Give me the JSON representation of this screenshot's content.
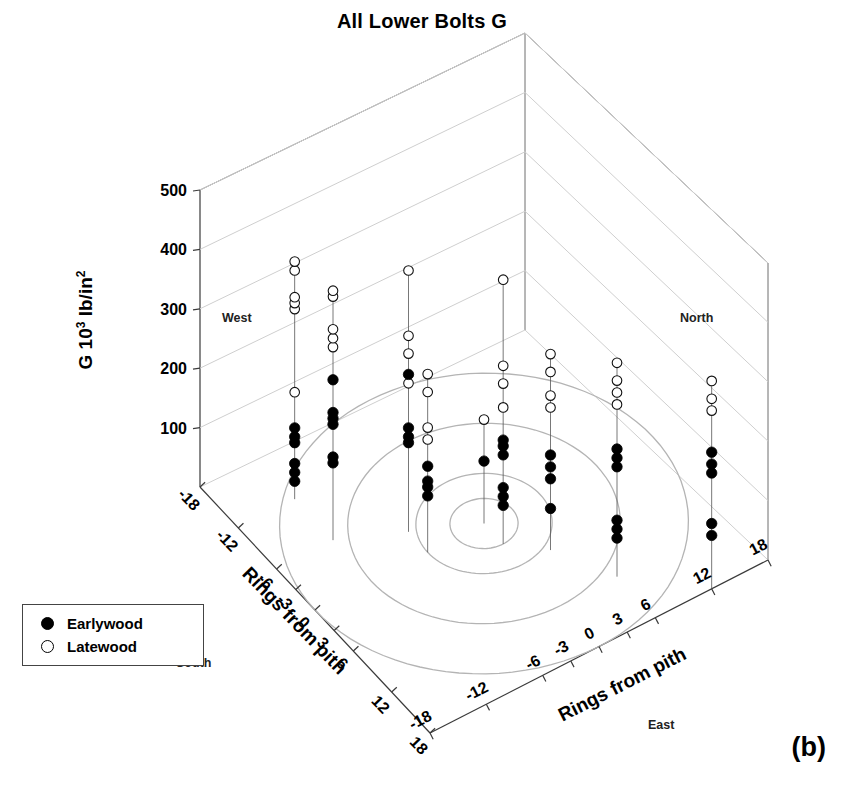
{
  "title": "All Lower Bolts G",
  "panel_label": "(b)",
  "legend": {
    "items": [
      {
        "label": "Earlywood",
        "marker": "filled-circle-icon",
        "color": "#000000"
      },
      {
        "label": "Latewood",
        "marker": "open-circle-icon",
        "color": "#ffffff"
      }
    ]
  },
  "compass": {
    "west": "West",
    "north": "North",
    "south": "South",
    "east": "East"
  },
  "zaxis": {
    "title_main": "G 10",
    "title_sup1": "3",
    "title_mid": " lb/in",
    "title_sup2": "2",
    "ticks": [
      "500",
      "400",
      "300",
      "200",
      "100"
    ]
  },
  "left_axis": {
    "title": "Rings from pith",
    "ticks": [
      "-18",
      "-12",
      "-6",
      "-3",
      "0",
      "3",
      "6",
      "12",
      "18"
    ]
  },
  "right_axis": {
    "title": "Rings from pith",
    "ticks": [
      "-18",
      "-12",
      "-6",
      "-3",
      "0",
      "3",
      "6",
      "12",
      "18"
    ]
  },
  "colors": {
    "earlywood": "#000000",
    "latewood": "#ffffff",
    "axis": "#3a3a3a",
    "grid": "#cfcfcf",
    "ring": "#b4b4b4"
  },
  "chart_data": {
    "type": "scatter",
    "projection": "3d",
    "title": "All Lower Bolts G",
    "xlabel": "Rings from pith",
    "ylabel": "Rings from pith",
    "zlabel": "G 10^3 lb/in^2",
    "xlim": [
      -18,
      18
    ],
    "ylim": [
      -18,
      18
    ],
    "zlim": [
      0,
      500
    ],
    "ztick_values": [
      100,
      200,
      300,
      400,
      500
    ],
    "xtick_values": [
      -18,
      -12,
      -6,
      -3,
      0,
      3,
      6,
      12,
      18
    ],
    "ytick_values": [
      -18,
      -12,
      -6,
      -3,
      0,
      3,
      6,
      12,
      18
    ],
    "grid": true,
    "legend_position": "lower-left",
    "base_rings": [
      3,
      6,
      12,
      18
    ],
    "series": [
      {
        "name": "Earlywood",
        "marker": "filled-circle",
        "points": [
          {
            "x": -12,
            "y": -12,
            "z": 120
          },
          {
            "x": -12,
            "y": -12,
            "z": 105
          },
          {
            "x": -12,
            "y": -12,
            "z": 95
          },
          {
            "x": -12,
            "y": -12,
            "z": 60
          },
          {
            "x": -12,
            "y": -12,
            "z": 45
          },
          {
            "x": -12,
            "y": -12,
            "z": 30
          },
          {
            "x": -6,
            "y": -12,
            "z": 270
          },
          {
            "x": -6,
            "y": -12,
            "z": 215
          },
          {
            "x": -6,
            "y": -12,
            "z": 205
          },
          {
            "x": -6,
            "y": -12,
            "z": 195
          },
          {
            "x": -6,
            "y": -12,
            "z": 140
          },
          {
            "x": -6,
            "y": -12,
            "z": 130
          },
          {
            "x": -3,
            "y": -6,
            "z": 265
          },
          {
            "x": -3,
            "y": -6,
            "z": 175
          },
          {
            "x": -3,
            "y": -6,
            "z": 160
          },
          {
            "x": -3,
            "y": -6,
            "z": 150
          },
          {
            "x": 0,
            "y": -6,
            "z": 145
          },
          {
            "x": 0,
            "y": -6,
            "z": 120
          },
          {
            "x": 0,
            "y": -6,
            "z": 110
          },
          {
            "x": 0,
            "y": -6,
            "z": 95
          },
          {
            "x": 0,
            "y": 0,
            "z": 105
          },
          {
            "x": 3,
            "y": 0,
            "z": 175
          },
          {
            "x": 3,
            "y": 0,
            "z": 165
          },
          {
            "x": 3,
            "y": 0,
            "z": 150
          },
          {
            "x": 3,
            "y": 0,
            "z": 95
          },
          {
            "x": 3,
            "y": 0,
            "z": 80
          },
          {
            "x": 3,
            "y": 0,
            "z": 65
          },
          {
            "x": 6,
            "y": 3,
            "z": 160
          },
          {
            "x": 6,
            "y": 3,
            "z": 140
          },
          {
            "x": 6,
            "y": 3,
            "z": 120
          },
          {
            "x": 6,
            "y": 3,
            "z": 70
          },
          {
            "x": 12,
            "y": 6,
            "z": 215
          },
          {
            "x": 12,
            "y": 6,
            "z": 200
          },
          {
            "x": 12,
            "y": 6,
            "z": 185
          },
          {
            "x": 12,
            "y": 6,
            "z": 95
          },
          {
            "x": 12,
            "y": 6,
            "z": 80
          },
          {
            "x": 12,
            "y": 6,
            "z": 65
          },
          {
            "x": 18,
            "y": 12,
            "z": 230
          },
          {
            "x": 18,
            "y": 12,
            "z": 210
          },
          {
            "x": 18,
            "y": 12,
            "z": 195
          },
          {
            "x": 18,
            "y": 12,
            "z": 110
          },
          {
            "x": 18,
            "y": 12,
            "z": 90
          }
        ]
      },
      {
        "name": "Latewood",
        "marker": "open-circle",
        "points": [
          {
            "x": -12,
            "y": -12,
            "z": 400
          },
          {
            "x": -12,
            "y": -12,
            "z": 385
          },
          {
            "x": -12,
            "y": -12,
            "z": 340
          },
          {
            "x": -12,
            "y": -12,
            "z": 330
          },
          {
            "x": -12,
            "y": -12,
            "z": 320
          },
          {
            "x": -12,
            "y": -12,
            "z": 180
          },
          {
            "x": -6,
            "y": -12,
            "z": 420
          },
          {
            "x": -6,
            "y": -12,
            "z": 410
          },
          {
            "x": -6,
            "y": -12,
            "z": 355
          },
          {
            "x": -6,
            "y": -12,
            "z": 340
          },
          {
            "x": -6,
            "y": -12,
            "z": 325
          },
          {
            "x": -3,
            "y": -6,
            "z": 440
          },
          {
            "x": -3,
            "y": -6,
            "z": 330
          },
          {
            "x": -3,
            "y": -6,
            "z": 300
          },
          {
            "x": -3,
            "y": -6,
            "z": 250
          },
          {
            "x": 0,
            "y": -6,
            "z": 300
          },
          {
            "x": 0,
            "y": -6,
            "z": 270
          },
          {
            "x": 0,
            "y": -6,
            "z": 210
          },
          {
            "x": 0,
            "y": -6,
            "z": 190
          },
          {
            "x": 0,
            "y": 0,
            "z": 175
          },
          {
            "x": 3,
            "y": 0,
            "z": 445
          },
          {
            "x": 3,
            "y": 0,
            "z": 300
          },
          {
            "x": 3,
            "y": 0,
            "z": 270
          },
          {
            "x": 3,
            "y": 0,
            "z": 230
          },
          {
            "x": 6,
            "y": 3,
            "z": 330
          },
          {
            "x": 6,
            "y": 3,
            "z": 300
          },
          {
            "x": 6,
            "y": 3,
            "z": 260
          },
          {
            "x": 6,
            "y": 3,
            "z": 240
          },
          {
            "x": 12,
            "y": 6,
            "z": 360
          },
          {
            "x": 12,
            "y": 6,
            "z": 330
          },
          {
            "x": 12,
            "y": 6,
            "z": 310
          },
          {
            "x": 12,
            "y": 6,
            "z": 290
          },
          {
            "x": 18,
            "y": 12,
            "z": 350
          },
          {
            "x": 18,
            "y": 12,
            "z": 320
          },
          {
            "x": 18,
            "y": 12,
            "z": 300
          }
        ]
      }
    ]
  }
}
